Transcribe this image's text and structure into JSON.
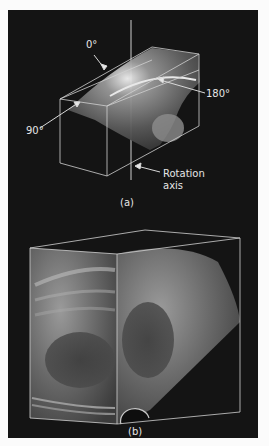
{
  "figure": {
    "panel_a": {
      "caption": "(a)",
      "angle_labels": {
        "top": "0°",
        "right": "180°",
        "left": "90°"
      },
      "axis_label_line1": "Rotation",
      "axis_label_line2": "axis"
    },
    "panel_b": {
      "caption": "(b)"
    },
    "colors": {
      "background": "#141414",
      "page": "#fbfbfb",
      "line": "#d8d8d8",
      "text": "#e6e6e6"
    }
  }
}
